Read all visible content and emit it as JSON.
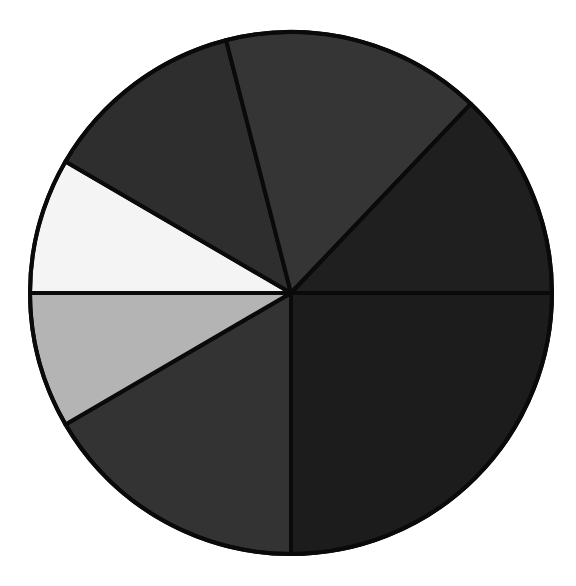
{
  "chart_data": {
    "type": "pie",
    "title": "",
    "labels": [
      "Slice 1",
      "Slice 2",
      "Slice 3",
      "Slice 4",
      "Slice 5",
      "Slice 6",
      "Slice 7"
    ],
    "values": [
      25.0,
      16.6,
      8.4,
      8.4,
      12.6,
      16.1,
      12.9
    ],
    "start_angle_deg": 0,
    "direction": "clockwise",
    "colors": [
      "#1c1c1c",
      "#333333",
      "#b4b4b4",
      "#f4f4f4",
      "#2e2e2e",
      "#353535",
      "#1f1f1f"
    ],
    "legend": false,
    "center": [
      291,
      293
    ],
    "radius": 261
  }
}
